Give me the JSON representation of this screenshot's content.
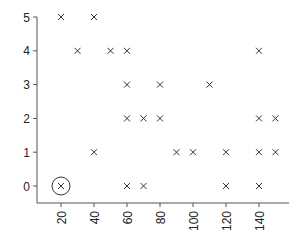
{
  "chart_data": {
    "type": "scatter",
    "title": "",
    "xlabel": "",
    "ylabel": "",
    "marker": "x",
    "grid": false,
    "legend": null,
    "xlim": [
      10,
      155
    ],
    "ylim": [
      -0.5,
      5
    ],
    "x_ticks": [
      20,
      40,
      60,
      80,
      100,
      120,
      140
    ],
    "y_ticks": [
      0,
      1,
      2,
      3,
      4,
      5
    ],
    "x_tick_labels": [
      "20",
      "40",
      "60",
      "80",
      "100",
      "120",
      "140"
    ],
    "y_tick_labels": [
      "0",
      "1",
      "2",
      "3",
      "4",
      "5"
    ],
    "x_tick_rotation": 90,
    "series": [
      {
        "name": "points",
        "points": [
          {
            "x": 20,
            "y": 5
          },
          {
            "x": 40,
            "y": 5
          },
          {
            "x": 30,
            "y": 4
          },
          {
            "x": 50,
            "y": 4
          },
          {
            "x": 60,
            "y": 4
          },
          {
            "x": 140,
            "y": 4
          },
          {
            "x": 60,
            "y": 3
          },
          {
            "x": 80,
            "y": 3
          },
          {
            "x": 110,
            "y": 3
          },
          {
            "x": 60,
            "y": 2
          },
          {
            "x": 70,
            "y": 2
          },
          {
            "x": 80,
            "y": 2
          },
          {
            "x": 140,
            "y": 2
          },
          {
            "x": 150,
            "y": 2
          },
          {
            "x": 40,
            "y": 1
          },
          {
            "x": 90,
            "y": 1
          },
          {
            "x": 100,
            "y": 1
          },
          {
            "x": 120,
            "y": 1
          },
          {
            "x": 140,
            "y": 1
          },
          {
            "x": 150,
            "y": 1
          },
          {
            "x": 20,
            "y": 0
          },
          {
            "x": 60,
            "y": 0
          },
          {
            "x": 70,
            "y": 0
          },
          {
            "x": 120,
            "y": 0
          },
          {
            "x": 140,
            "y": 0
          }
        ]
      }
    ],
    "annotations": [
      {
        "type": "circle",
        "x": 20,
        "y": 0,
        "label": "highlighted point"
      }
    ]
  },
  "colors": {
    "marker": "#333333",
    "axis": "#555555",
    "text": "#222222",
    "background": "#ffffff"
  }
}
